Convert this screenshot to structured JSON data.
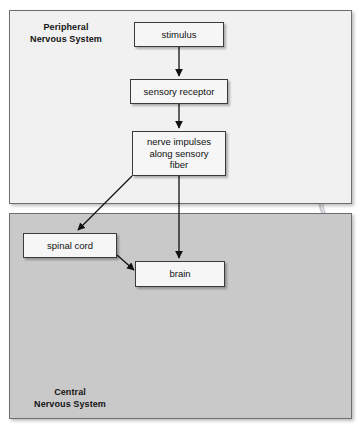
{
  "diagram": {
    "panels": [
      {
        "id": "peripheral",
        "caption": "Peripheral\nNervous System",
        "background_color": "#f1f1f1"
      },
      {
        "id": "central",
        "caption": "Central\nNervous System",
        "background_color": "#c9c9c9"
      }
    ],
    "boxes": [
      {
        "id": "stimulus",
        "label": "stimulus"
      },
      {
        "id": "sensory_receptor",
        "label": "sensory receptor"
      },
      {
        "id": "nerve_impulses",
        "label": "nerve impulses\nalong sensory\nfiber"
      },
      {
        "id": "spinal_cord",
        "label": "spinal cord"
      },
      {
        "id": "brain",
        "label": "brain"
      }
    ],
    "connections": [
      {
        "from": "stimulus",
        "to": "sensory_receptor",
        "style": "straight-down"
      },
      {
        "from": "sensory_receptor",
        "to": "nerve_impulses",
        "style": "straight-down"
      },
      {
        "from": "nerve_impulses",
        "to": "spinal_cord",
        "style": "diagonal-left-down"
      },
      {
        "from": "nerve_impulses",
        "to": "brain",
        "style": "straight-down"
      },
      {
        "from": "spinal_cord",
        "to": "brain",
        "style": "diagonal-right-down"
      }
    ],
    "illustrations": [
      {
        "id": "sensory-receptor-cell",
        "name": "sensory receptor cell with cilia and nerve fiber"
      },
      {
        "id": "spinal-cord-cross-section",
        "name": "spinal cord cross section"
      },
      {
        "id": "head-brain-profile",
        "name": "human head in profile showing brain and brainstem"
      }
    ],
    "colors": {
      "panel_border": "#6e6e6e",
      "box_border": "#3a3a3a",
      "box_fill": "#f6f6f6",
      "arrow": "#111111",
      "text": "#111111"
    }
  }
}
